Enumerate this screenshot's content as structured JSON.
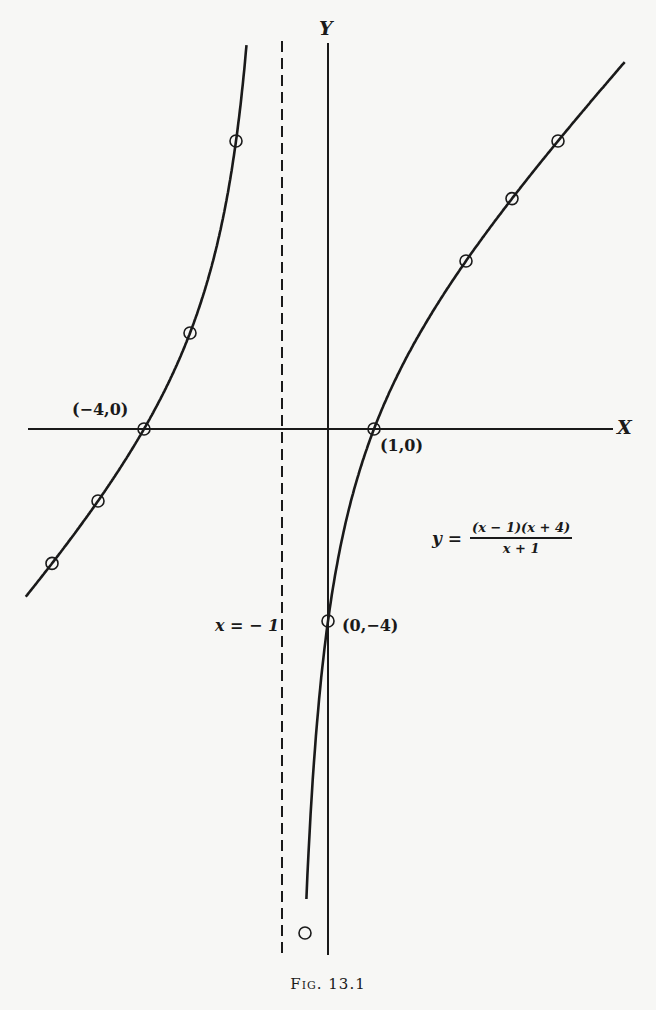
{
  "figure": {
    "caption": "Fig. 13.1",
    "axis_labels": {
      "x": "X",
      "y": "Y"
    },
    "point_labels": {
      "neg4_0": "(−4,0)",
      "one_0": "(1,0)",
      "zero_neg4": "(0,−4)"
    },
    "asymptote_label": "x = − 1",
    "equation": {
      "lhs": "y =",
      "numerator": "(x − 1)(x + 4)",
      "denominator": "x + 1"
    }
  },
  "chart_data": {
    "type": "line",
    "title": "Fig. 13.1",
    "function": "y = (x - 1)(x + 4) / (x + 1)",
    "xlabel": "X",
    "ylabel": "Y",
    "grid": false,
    "legend": null,
    "vertical_asymptote": {
      "x": -1,
      "label": "x = -1",
      "style": "dashed"
    },
    "intercepts": [
      {
        "x": -4,
        "y": 0,
        "label": "(-4,0)"
      },
      {
        "x": 1,
        "y": 0,
        "label": "(1,0)"
      },
      {
        "x": 0,
        "y": -4,
        "label": "(0,-4)"
      }
    ],
    "series": [
      {
        "name": "left branch (x < -1)",
        "x": [
          -6,
          -5,
          -4,
          -3,
          -2
        ],
        "y": [
          -2.8,
          -1.5,
          0,
          2,
          6
        ]
      },
      {
        "name": "right branch (x > -1)",
        "x": [
          -0.5,
          0,
          1,
          3,
          4,
          5
        ],
        "y": [
          -10.5,
          -4,
          0,
          3.5,
          4.8,
          6
        ]
      }
    ],
    "xlim": [
      -6.6,
      6.6
    ],
    "ylim": [
      -11,
      8.4
    ]
  },
  "render": {
    "origin_px": [
      328,
      429
    ],
    "scale_px": [
      46,
      48
    ],
    "x_axis_px": [
      28,
      613
    ],
    "y_axis_px": [
      43,
      955
    ],
    "asymptote_px": [
      41,
      955
    ],
    "clip_top_px": 41,
    "clip_bottom_px": 955,
    "left_branch_x": [
      -6.57,
      -1.74
    ],
    "right_branch_x": [
      -0.47,
      6.45
    ],
    "colors": {
      "ink": "#1a1a1a",
      "paper": "#f7f7f5"
    }
  }
}
